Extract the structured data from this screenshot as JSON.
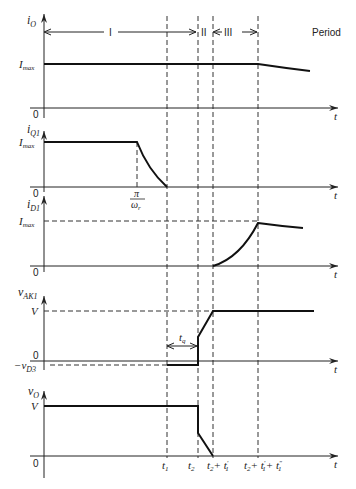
{
  "figure": {
    "period_label": "Period",
    "periods": [
      {
        "label": "I",
        "from": "0",
        "to": "t1 + (t2 - t1)"
      },
      {
        "label": "II",
        "from": "t2",
        "to": "t2 + t1'"
      },
      {
        "label": "III",
        "from": "t2 + t1'",
        "to": "t2 + t1' + t1''"
      }
    ],
    "time_marks": {
      "t1": "t",
      "t1_sub": "1",
      "t2": "t",
      "t2_sub": "2",
      "t3_a": "t",
      "t3_a_sub": "2",
      "t3_b": "+ t",
      "t3_b_sup": "′",
      "t3_b_sub": "1",
      "t4_a": "t",
      "t4_a_sub": "2",
      "t4_b": "+ t",
      "t4_b_sup": "′",
      "t4_b_sub": "1",
      "t4_c": "+ t",
      "t4_c_sup": "″",
      "t4_c_sub": "1"
    },
    "axis_t_label": "t",
    "zero_label": "0",
    "panels": [
      {
        "id": "iO",
        "ylabel": "i",
        "ylabel_sub": "O",
        "level_label": "I",
        "level_label_sub": "max",
        "zero": "0"
      },
      {
        "id": "iQ1",
        "ylabel": "i",
        "ylabel_sub": "Q1",
        "level_label": "I",
        "level_label_sub": "max",
        "zero": "0",
        "annotation_num": "π",
        "annotation_den": "ω",
        "annotation_den_sub": "r"
      },
      {
        "id": "iD1",
        "ylabel": "i",
        "ylabel_sub": "D1",
        "level_label": "I",
        "level_label_sub": "max",
        "zero": "0"
      },
      {
        "id": "vAK1",
        "ylabel": "v",
        "ylabel_sub": "AK1",
        "level_label": "V",
        "zero": "0",
        "neg_label": "−v",
        "neg_label_sub": "D3",
        "interval_label": "t",
        "interval_label_sub": "q"
      },
      {
        "id": "vO",
        "ylabel": "v",
        "ylabel_sub": "O",
        "level_label": "V",
        "zero": "0"
      }
    ]
  }
}
